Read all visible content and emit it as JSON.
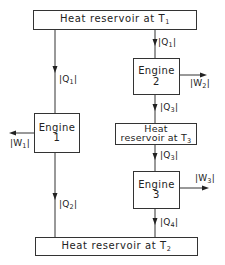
{
  "diagram": {
    "reservoir_top": {
      "text": "Heat reservoir at T",
      "sub": "1"
    },
    "reservoir_bottom": {
      "text": "Heat reservoir at T",
      "sub": "2"
    },
    "reservoir_mid": {
      "line1": "Heat",
      "line2": "reservoir at T",
      "sub": "3"
    },
    "engine1": {
      "line1": "Engine",
      "line2": "1"
    },
    "engine2": {
      "line1": "Engine",
      "line2": "2"
    },
    "engine3": {
      "line1": "Engine",
      "line2": "3"
    },
    "flows": {
      "q1_left": {
        "text": "|Q",
        "sub": "1",
        "close": "|"
      },
      "q1_right": {
        "text": "|Q",
        "sub": "1",
        "close": "|"
      },
      "q2": {
        "text": "|Q",
        "sub": "2",
        "close": "|"
      },
      "q3_upper": {
        "text": "|Q",
        "sub": "3",
        "close": "|"
      },
      "q3_lower": {
        "text": "|Q",
        "sub": "3",
        "close": "|"
      },
      "q4": {
        "text": "|Q",
        "sub": "4",
        "close": "|"
      },
      "w1": {
        "text": "|W",
        "sub": "1",
        "close": "|"
      },
      "w2": {
        "text": "|W",
        "sub": "2",
        "close": "|"
      },
      "w3": {
        "text": "|W",
        "sub": "3",
        "close": "|"
      }
    }
  }
}
